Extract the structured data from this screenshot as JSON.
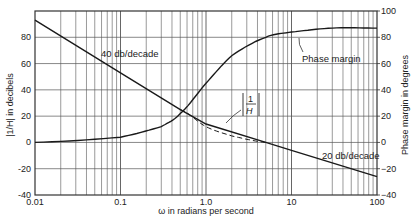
{
  "chart_data": {
    "type": "line",
    "title": "",
    "xlabel": "ω in radians per second",
    "ylabel_left": "|1/H| in decibels",
    "ylabel_right": "Phase margin in degrees",
    "xscale": "log",
    "xlim": [
      0.01,
      100
    ],
    "ylim_left": [
      -40,
      100
    ],
    "ylim_right": [
      -40,
      100
    ],
    "x_ticks": [
      "0.01",
      "0.1",
      "1.0",
      "10",
      "100"
    ],
    "y_ticks_left": [
      "-40",
      "-20",
      "0",
      "20",
      "40",
      "60",
      "80"
    ],
    "y_ticks_right": [
      "-40",
      "-20",
      "0",
      "20",
      "40",
      "60",
      "80",
      "100"
    ],
    "grid": true,
    "series": [
      {
        "name": "|1/H| asymptote",
        "style": "solid",
        "x": [
          0.01,
          0.1,
          0.5,
          1.0,
          5.0,
          10,
          100
        ],
        "values": [
          93,
          53,
          25,
          14,
          0,
          -6,
          -26
        ]
      },
      {
        "name": "|1/H| actual",
        "style": "dashed",
        "x": [
          0.5,
          1.0,
          2.0,
          5.0
        ],
        "values": [
          25,
          12,
          5,
          0
        ]
      },
      {
        "name": "Phase margin",
        "style": "solid",
        "axis": "right",
        "x": [
          0.01,
          0.1,
          0.3,
          0.5,
          1.0,
          2.0,
          5.0,
          10,
          30,
          100
        ],
        "values": [
          0,
          4,
          12,
          22,
          45,
          66,
          80,
          84,
          87,
          87
        ]
      }
    ],
    "annotations": [
      "40 db/decade",
      "20 db/decade",
      "Phase margin",
      "|1/H|"
    ]
  },
  "labels": {
    "slope40": "40 db/decade",
    "slope20": "20 db/decade",
    "phase": "Phase margin",
    "inv_h_num": "1",
    "inv_h_den": "H"
  }
}
